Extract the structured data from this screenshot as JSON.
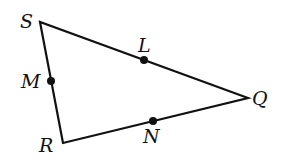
{
  "diagram": {
    "type": "triangle",
    "stroke_color": "#111111",
    "vertices": [
      {
        "name": "S",
        "x": 40,
        "y": 22,
        "label_x": 20,
        "label_y": 22
      },
      {
        "name": "R",
        "x": 63,
        "y": 143,
        "label_x": 39,
        "label_y": 152
      },
      {
        "name": "Q",
        "x": 248,
        "y": 98,
        "label_x": 252,
        "label_y": 105
      }
    ],
    "points": [
      {
        "name": "M",
        "x": 51,
        "y": 81,
        "label_x": 22,
        "label_y": 88,
        "on_side": "SR"
      },
      {
        "name": "L",
        "x": 144,
        "y": 60,
        "label_x": 137,
        "label_y": 52,
        "on_side": "SQ"
      },
      {
        "name": "N",
        "x": 153,
        "y": 121,
        "label_x": 143,
        "label_y": 142,
        "on_side": "RQ"
      }
    ]
  }
}
